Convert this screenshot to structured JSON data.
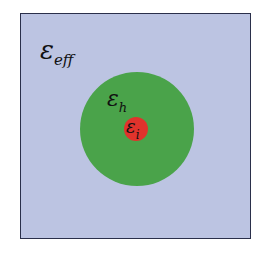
{
  "diagram": {
    "effective_medium": {
      "symbol": "ε",
      "subscript": "eff",
      "color": "#bcc4e2"
    },
    "host": {
      "symbol": "ε",
      "subscript": "h",
      "color": "#4aa34a"
    },
    "inclusion": {
      "symbol": "ε",
      "subscript": "i",
      "color": "#e0332c"
    }
  }
}
